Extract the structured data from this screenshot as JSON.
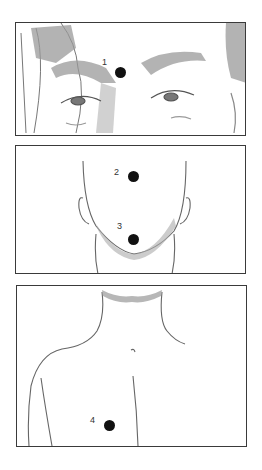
{
  "diagram": {
    "title": "",
    "panels": [
      {
        "id": "face-eyes",
        "description": "Sketch of upper face showing eyes and eyebrows",
        "points": [
          {
            "label": "1",
            "location": "between eyebrows"
          }
        ]
      },
      {
        "id": "chin-back-of-head",
        "description": "Outline of head viewed from behind/under chin with beard shading",
        "points": [
          {
            "label": "2",
            "location": "center of head"
          },
          {
            "label": "3",
            "location": "chin"
          }
        ]
      },
      {
        "id": "shoulder-chest",
        "description": "Outline of neck, shoulder and upper chest",
        "points": [
          {
            "label": "4",
            "location": "lower chest"
          }
        ]
      }
    ]
  }
}
